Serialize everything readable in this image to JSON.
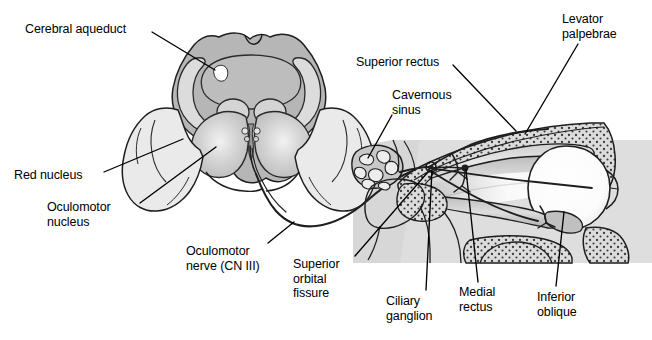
{
  "figure": {
    "panels": [
      {
        "name": "midbrain-cross-section",
        "description": "Transverse section of midbrain at the level of the superior colliculus"
      },
      {
        "name": "orbit-sagittal-section",
        "description": "Sagittal section of the orbit showing extraocular muscles and ciliary ganglion"
      }
    ]
  },
  "colors": {
    "background": "#ffffff",
    "ink": "#000000",
    "panel_gray": "#d9d9d9",
    "tegmentum_gray": "#b4b4b4",
    "peduncle_gray": "#c9c9c9",
    "pale_gray": "#ebebeb",
    "bone_gray": "#dcdcdc",
    "muscle_gray": "#c4c4c4",
    "nerve_ink": "#1a1a1a",
    "aqueduct_white": "#ffffff"
  },
  "labels": [
    {
      "id": "cerebral-aqueduct",
      "text": "Cerebral aqueduct",
      "x": 25,
      "y": 22,
      "align": "left",
      "leader": {
        "x1": 152,
        "y1": 32,
        "x2": 215,
        "y2": 70
      }
    },
    {
      "id": "red-nucleus",
      "text": "Red nucleus",
      "x": 14,
      "y": 168,
      "align": "left",
      "leader": {
        "x1": 104,
        "y1": 172,
        "x2": 183,
        "y2": 139
      }
    },
    {
      "id": "oculomotor-nucleus",
      "text": "Oculomotor\nnucleus",
      "x": 47,
      "y": 200,
      "align": "left",
      "leader": {
        "x1": 140,
        "y1": 203,
        "x2": 216,
        "y2": 147
      }
    },
    {
      "id": "oculomotor-nerve",
      "text": "Oculomotor\nnerve (CN III)",
      "x": 186,
      "y": 244,
      "align": "left",
      "leader": {
        "x1": 268,
        "y1": 243,
        "x2": 294,
        "y2": 222
      }
    },
    {
      "id": "superior-orbital-fissure",
      "text": "Superior\norbital\nfissure",
      "x": 293,
      "y": 257,
      "align": "left",
      "leader": {
        "x1": 355,
        "y1": 256,
        "x2": 428,
        "y2": 172
      }
    },
    {
      "id": "superior-rectus",
      "text": "Superior rectus",
      "x": 356,
      "y": 55,
      "align": "left",
      "leader": {
        "x1": 453,
        "y1": 65,
        "x2": 516,
        "y2": 131
      }
    },
    {
      "id": "cavernous-sinus",
      "text": "Cavernous\nsinus",
      "x": 392,
      "y": 88,
      "align": "left",
      "leader": {
        "x1": 392,
        "y1": 115,
        "x2": 368,
        "y2": 158
      }
    },
    {
      "id": "levator-palpebrae",
      "text": "Levator\npalpebrae",
      "x": 562,
      "y": 12,
      "align": "left",
      "leader": {
        "x1": 578,
        "y1": 44,
        "x2": 525,
        "y2": 134
      }
    },
    {
      "id": "ciliary-ganglion",
      "text": "Ciliary\nganglion",
      "x": 386,
      "y": 294,
      "align": "left",
      "leader": {
        "x1": 426,
        "y1": 290,
        "x2": 432,
        "y2": 170
      }
    },
    {
      "id": "medial-rectus",
      "text": "Medial\nrectus",
      "x": 459,
      "y": 285,
      "align": "left",
      "leader": {
        "x1": 478,
        "y1": 282,
        "x2": 466,
        "y2": 170
      }
    },
    {
      "id": "inferior-oblique",
      "text": "Inferior\noblique",
      "x": 537,
      "y": 290,
      "align": "left",
      "leader": {
        "x1": 556,
        "y1": 286,
        "x2": 564,
        "y2": 212
      }
    }
  ]
}
